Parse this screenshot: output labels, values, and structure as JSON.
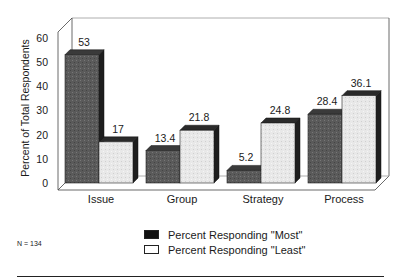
{
  "chart_data": {
    "type": "bar",
    "style": "3d-grouped",
    "title": "",
    "xlabel": "",
    "ylabel": "Percent of Total Respondents",
    "ylim": [
      0,
      60
    ],
    "yticks": [
      0,
      10,
      20,
      30,
      40,
      50,
      60
    ],
    "grid": false,
    "categories": [
      "Issue",
      "Group",
      "Strategy",
      "Process"
    ],
    "series": [
      {
        "name": "Percent Responding \"Most\"",
        "color": "#555555",
        "values": [
          53,
          13.4,
          5.2,
          28.4
        ],
        "labels": [
          "53",
          "13.4",
          "5.2",
          "28.4"
        ]
      },
      {
        "name": "Percent Responding \"Least\"",
        "color": "#e6e6e6",
        "values": [
          17,
          21.8,
          24.8,
          36.1
        ],
        "labels": [
          "17",
          "21.8",
          "24.8",
          "36.1"
        ]
      }
    ],
    "legend_position": "bottom-center",
    "annotations": [
      "N = 134"
    ]
  },
  "legend": {
    "most": "Percent Responding \"Most\"",
    "least": "Percent Responding \"Least\""
  },
  "footnote": "N = 134"
}
